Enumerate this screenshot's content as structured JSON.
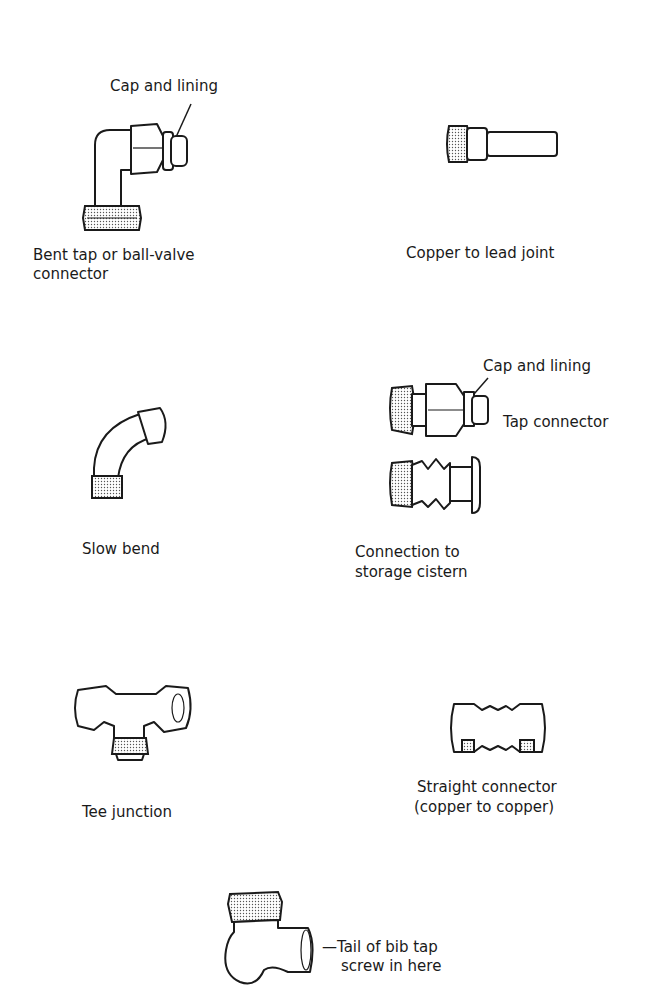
{
  "figure": {
    "items": [
      {
        "id": "bent-tap",
        "label_line1": "Bent tap or ball-valve",
        "label_line2": "connector",
        "callout": "Cap and lining"
      },
      {
        "id": "copper-lead",
        "label": "Copper to lead joint"
      },
      {
        "id": "tap-connector",
        "label": "Tap connector",
        "callout": "Cap and lining"
      },
      {
        "id": "storage-cistern",
        "label_line1": "Connection to",
        "label_line2": "storage cistern"
      },
      {
        "id": "slow-bend",
        "label": "Slow bend"
      },
      {
        "id": "tee-junction",
        "label": "Tee junction"
      },
      {
        "id": "straight-connector",
        "label_line1": "Straight connector",
        "label_line2": "(copper to copper)"
      },
      {
        "id": "bib-tap-elbow",
        "label_line1": "—Tail of bib tap",
        "label_line2": "screw in here"
      }
    ]
  }
}
